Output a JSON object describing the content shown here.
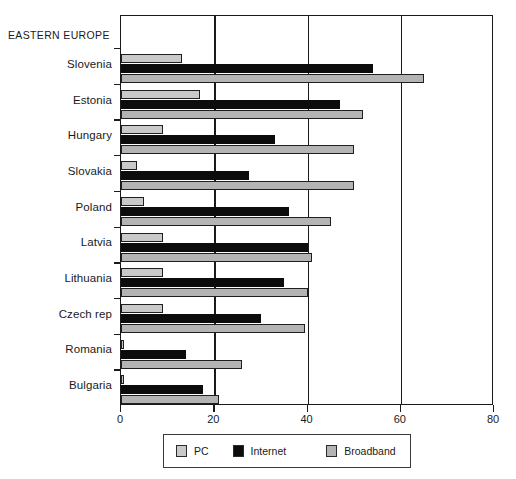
{
  "chart_data": {
    "type": "bar",
    "orientation": "horizontal",
    "title": "",
    "region_label": "EASTERN EUROPE",
    "xlabel": "",
    "ylabel": "",
    "xlim": [
      0,
      80
    ],
    "xticks": [
      0,
      20,
      40,
      60,
      80
    ],
    "grid": true,
    "legend_position": "bottom",
    "categories": [
      "Slovenia",
      "Estonia",
      "Hungary",
      "Slovakia",
      "Poland",
      "Latvia",
      "Lithuania",
      "Czech rep",
      "Romania",
      "Bulgaria"
    ],
    "series": [
      {
        "name": "PC",
        "color": "#c9c9c9",
        "values": [
          13,
          17,
          9,
          3.5,
          5,
          9,
          9,
          9,
          0.7,
          0.7
        ]
      },
      {
        "name": "Internet",
        "color": "#0c0c0c",
        "values": [
          54,
          47,
          33,
          27.5,
          36,
          40,
          35,
          30,
          14,
          17.5
        ]
      },
      {
        "name": "Broadband",
        "color": "#b4b4b4",
        "values": [
          65,
          52,
          50,
          50,
          45,
          41,
          40,
          39.5,
          26,
          21
        ]
      }
    ]
  },
  "legend": {
    "items": [
      {
        "label": "PC",
        "swatch": "#c9c9c9"
      },
      {
        "label": "Internet",
        "swatch": "#0c0c0c"
      },
      {
        "label": "Broadband",
        "swatch": "#b4b4b4"
      }
    ]
  },
  "colors": {
    "axis": "#1a1a1a",
    "background": "#ffffff",
    "pc": "#c9c9c9",
    "internet": "#0c0c0c",
    "broadband": "#b4b4b4"
  }
}
